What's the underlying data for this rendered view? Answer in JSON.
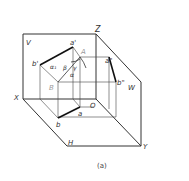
{
  "diagram": {
    "caption": "(a)",
    "planes": {
      "V": "V",
      "H": "H",
      "W": "W"
    },
    "axes": {
      "X": "X",
      "Y": "Y",
      "Z": "Z",
      "O": "O"
    },
    "points": {
      "a_prime": "a'",
      "b_prime": "b'",
      "A": "A",
      "B": "B",
      "a_dblprime": "a\"",
      "b_dblprime": "b\"",
      "a": "a",
      "b": "b"
    },
    "angles": {
      "alpha1": "α₁",
      "beta": "β",
      "gamma": "γ",
      "alpha": "α"
    },
    "colors": {
      "line": "#222222",
      "thin": "#444444",
      "label": "#333333",
      "light_label": "#999999"
    }
  }
}
